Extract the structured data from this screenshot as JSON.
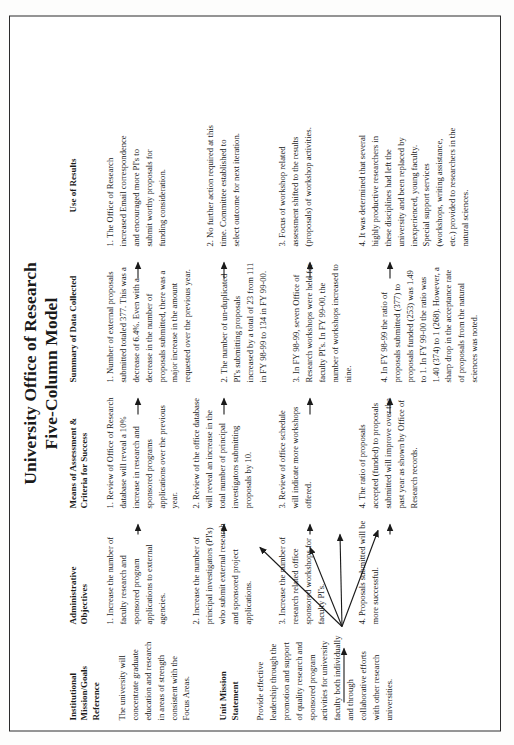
{
  "document": {
    "title_line_1": "University Office of Research",
    "title_line_2": "Five-Column Model"
  },
  "columns": {
    "mission_header": "Institutional\nMission/Goals\nReference",
    "objectives_header": "Administrative\nObjectives",
    "means_header": "Means of Assessment &\nCriteria for Success",
    "data_header": "Summary of Data Collected",
    "results_header": "Use of Results"
  },
  "mission": {
    "institutional_body": "The university will concentrate graduate education and research in areas of strength consistent with the Focus Areas.",
    "unit_header": "Unit Mission\nStatement",
    "unit_body": "Provide effective leadership through the promotion and support of quality research and sponsored program activities for university faculty both individually and through collaborative efforts with other research universities."
  },
  "objectives": [
    "1.  Increase the number of faculty research and sponsored program applications to external agencies.",
    "2.  Increase the number of principal investigators (PI's) who submit external research and sponsored project applications.",
    "3.  Increase the number of research related office sponsored workshops for faculty PI's.",
    "4.  Proposals submitted will be more successful."
  ],
  "means": [
    "1.  Review of Office of Research database will reveal a 10% increase in research and sponsored programs applications over the previous year.",
    "2.  Review of the office database will reveal an increase in the total number of principal investigators submitting proposals by 10.",
    "3.  Review of office schedule will indicate more workshops offered.",
    "4.  The ratio of proposals accepted (funded) to proposals submitted will improve over the past year as shown by Office of Research records."
  ],
  "data_collected": [
    "1.  Number of external proposals submitted totaled 377.  This was a decrease of 6.4%. Even with a decrease in the number of proposals submitted, there was a major increase in the amount requested over the previous year.",
    "2.  The number of un-duplicated PI's submitting proposals increased by a total of 23 from 111 in FY 98-99 to 134 in FY 99-00.",
    "3.  In FY 98-99, seven Office of Research workshops were held for faculty PI's.  In FY 99-00, the number of workshops increased to nine.",
    "4.  In FY 98-99 the ratio of proposals submitted (377) to proposals funded (253) was 1.49 to 1.  In FY 99-00 the ratio was 1.40 (374) to 1 (268).  However, a sharp drop in the acceptance rate of proposals from the natural sciences was noted."
  ],
  "use_of_results": [
    "1.  The Office of Research increased Email correspondence and encouraged more PI's to submit worthy proposals for funding consideration.",
    "2.  No further action required at this time.  Committee established to select outcome for next iteration.",
    "3.  Focus of workshop related assessment shifted to the results (proposals) of workshop activities.",
    "4.  It was determined that several highly productive researchers in these disciplines had left the university and been replaced by inexperienced, young faculty. Special support services (workshops, writing assistance, etc.) provided to researchers in the natural sciences."
  ],
  "colors": {
    "page_background": "#ffffff",
    "border": "#2b2b2b",
    "text": "#1a1a1a"
  }
}
